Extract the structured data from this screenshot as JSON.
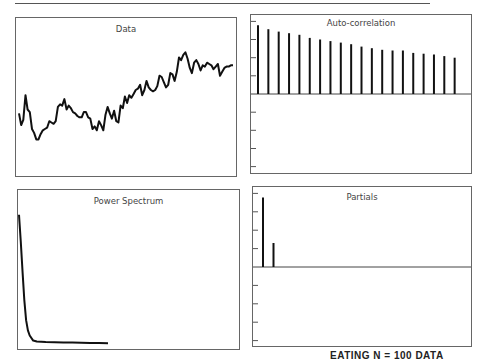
{
  "caption": "EATING   N = 100 DATA",
  "chart_data": [
    {
      "type": "line",
      "title": "Data",
      "xlabel": "",
      "ylabel": "",
      "grid": false,
      "x": [
        0,
        1,
        2,
        3,
        4,
        5,
        6,
        7,
        8,
        9,
        10,
        11,
        12,
        13,
        14,
        15,
        16,
        17,
        18,
        19,
        20,
        21,
        22,
        23,
        24,
        25,
        26,
        27,
        28,
        29,
        30,
        31,
        32,
        33,
        34,
        35,
        36,
        37,
        38,
        39,
        40,
        41,
        42,
        43,
        44,
        45,
        46,
        47,
        48,
        49,
        50,
        51,
        52,
        53,
        54,
        55,
        56,
        57,
        58,
        59,
        60,
        61,
        62,
        63,
        64,
        65,
        66,
        67,
        68,
        69,
        70,
        71,
        72,
        73,
        74,
        75,
        76,
        77,
        78,
        79,
        80,
        81,
        82,
        83,
        84,
        85,
        86,
        87,
        88,
        89,
        90,
        91,
        92,
        93,
        94,
        95,
        96,
        97,
        98,
        99
      ],
      "values": [
        0.42,
        0.33,
        0.37,
        0.56,
        0.45,
        0.43,
        0.3,
        0.27,
        0.22,
        0.22,
        0.26,
        0.29,
        0.3,
        0.31,
        0.36,
        0.35,
        0.34,
        0.36,
        0.47,
        0.49,
        0.48,
        0.53,
        0.45,
        0.48,
        0.46,
        0.43,
        0.42,
        0.4,
        0.39,
        0.39,
        0.43,
        0.43,
        0.39,
        0.38,
        0.3,
        0.32,
        0.29,
        0.36,
        0.33,
        0.29,
        0.41,
        0.47,
        0.42,
        0.38,
        0.44,
        0.36,
        0.35,
        0.48,
        0.46,
        0.55,
        0.5,
        0.56,
        0.54,
        0.57,
        0.6,
        0.61,
        0.64,
        0.56,
        0.6,
        0.67,
        0.62,
        0.6,
        0.59,
        0.6,
        0.63,
        0.71,
        0.7,
        0.66,
        0.62,
        0.64,
        0.73,
        0.72,
        0.67,
        0.74,
        0.85,
        0.83,
        0.87,
        0.89,
        0.84,
        0.77,
        0.73,
        0.81,
        0.83,
        0.8,
        0.75,
        0.79,
        0.78,
        0.81,
        0.8,
        0.79,
        0.76,
        0.78,
        0.8,
        0.71,
        0.74,
        0.77,
        0.78,
        0.78,
        0.79,
        0.79
      ]
    },
    {
      "type": "bar",
      "title": "Auto-correlation",
      "xlabel": "Lag",
      "ylabel": "",
      "ylim": [
        -1,
        1
      ],
      "grid": false,
      "categories": [
        1,
        2,
        3,
        4,
        5,
        6,
        7,
        8,
        9,
        10,
        11,
        12,
        13,
        14,
        15,
        16,
        17,
        18,
        19,
        20
      ],
      "values": [
        0.87,
        0.82,
        0.79,
        0.77,
        0.75,
        0.71,
        0.69,
        0.67,
        0.65,
        0.63,
        0.6,
        0.58,
        0.56,
        0.55,
        0.55,
        0.52,
        0.51,
        0.5,
        0.48,
        0.46
      ]
    },
    {
      "type": "line",
      "title": "Power Spectrum",
      "xlabel": "Frequency",
      "ylabel": "",
      "grid": false,
      "x": [
        0.0,
        0.01,
        0.02,
        0.03,
        0.04,
        0.05,
        0.06,
        0.08,
        0.1,
        0.15,
        0.2,
        0.25,
        0.3,
        0.35,
        0.4,
        0.45,
        0.5
      ],
      "values": [
        0.76,
        0.6,
        0.42,
        0.26,
        0.14,
        0.08,
        0.05,
        0.02,
        0.015,
        0.012,
        0.01,
        0.009,
        0.008,
        0.007,
        0.006,
        0.006,
        0.005
      ]
    },
    {
      "type": "bar",
      "title": "Partials",
      "xlabel": "Lag",
      "ylabel": "",
      "ylim": [
        -1,
        1
      ],
      "grid": false,
      "categories": [
        1,
        2
      ],
      "values": [
        0.87,
        0.3
      ]
    }
  ],
  "panels": {
    "data": {
      "title": "Data"
    },
    "acf": {
      "title": "Auto-correlation"
    },
    "spectrum": {
      "title": "Power Spectrum"
    },
    "partials": {
      "title": "Partials"
    }
  }
}
